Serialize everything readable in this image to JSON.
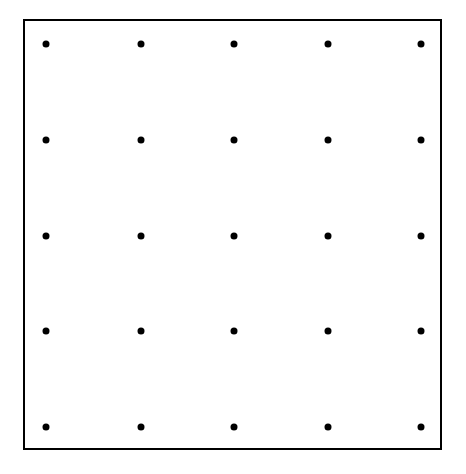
{
  "diagram": {
    "type": "dot-grid",
    "rows": 5,
    "columns": 5,
    "dot_color": "#000000",
    "border_color": "#000000",
    "background": "#ffffff",
    "column_x": [
      46,
      141,
      234,
      328,
      421
    ],
    "row_y": [
      44,
      140,
      236,
      331,
      427
    ]
  }
}
